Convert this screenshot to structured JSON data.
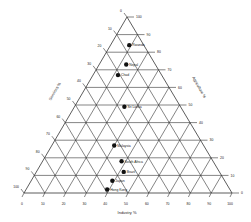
{
  "chart_data": {
    "type": "scatter",
    "subtype": "ternary",
    "axes": {
      "bottom": {
        "label": "Industry %",
        "ticks": [
          "0",
          "10",
          "20",
          "30",
          "40",
          "50",
          "60",
          "70",
          "80",
          "90",
          "100"
        ]
      },
      "right": {
        "label": "Agriculture %",
        "ticks": [
          "0",
          "10",
          "20",
          "30",
          "40",
          "50",
          "60",
          "70",
          "80",
          "90",
          "100"
        ]
      },
      "left": {
        "label": "Services %",
        "ticks": [
          "0",
          "10",
          "20",
          "30",
          "40",
          "50",
          "60",
          "70",
          "80",
          "90",
          "100"
        ]
      }
    },
    "grid": true,
    "points": [
      {
        "label": "Rwanda",
        "agriculture": 84,
        "industry": 9,
        "services": 7
      },
      {
        "label": "Nepal",
        "agriculture": 73,
        "industry": 13,
        "services": 14
      },
      {
        "label": "Chad",
        "agriculture": 67,
        "industry": 12,
        "services": 21
      },
      {
        "label": "Sri Lanka",
        "agriculture": 49,
        "industry": 24,
        "services": 27
      },
      {
        "label": "Malaysia",
        "agriculture": 27,
        "industry": 30,
        "services": 43
      },
      {
        "label": "South Africa",
        "agriculture": 18,
        "industry": 38,
        "services": 44
      },
      {
        "label": "Brazil",
        "agriculture": 12,
        "industry": 42,
        "services": 46
      },
      {
        "label": "Japan",
        "agriculture": 7,
        "industry": 39,
        "services": 54
      },
      {
        "label": "Hong Kong",
        "agriculture": 2,
        "industry": 39,
        "services": 59
      }
    ]
  }
}
